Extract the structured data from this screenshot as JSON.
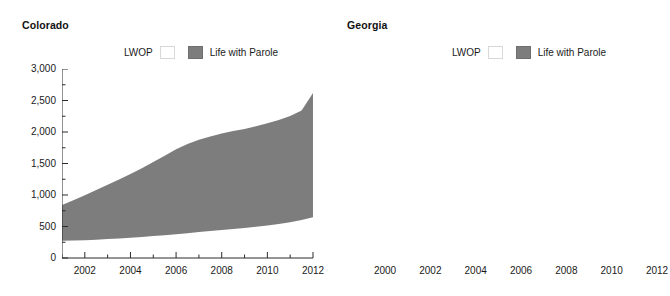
{
  "figure": {
    "panels": [
      {
        "id": "colorado",
        "title": "Colorado",
        "legend": [
          {
            "key": "lwop",
            "label": "LWOP",
            "color": "#ffffff"
          },
          {
            "key": "lwp",
            "label": "Life with Parole",
            "color": "#7d7d7d"
          }
        ],
        "y_ticks": [
          "0",
          "500",
          "1,000",
          "1,500",
          "2,000",
          "2,500",
          "3,000"
        ],
        "x_ticks": [
          "2002",
          "2004",
          "2006",
          "2008",
          "2010",
          "2012"
        ]
      },
      {
        "id": "georgia",
        "title": "Georgia",
        "legend": [
          {
            "key": "lwop",
            "label": "LWOP",
            "color": "#ffffff"
          },
          {
            "key": "lwp",
            "label": "Life with Parole",
            "color": "#7d7d7d"
          }
        ],
        "y_ticks": [
          "0",
          "2,000",
          "4,000",
          "6,000",
          "8,000",
          "10,000"
        ],
        "x_ticks": [
          "2000",
          "2002",
          "2004",
          "2006",
          "2008",
          "2010",
          "2012"
        ]
      }
    ]
  },
  "chart_data": [
    {
      "type": "area",
      "id": "colorado",
      "title": "Colorado",
      "stacked": true,
      "xlabel": "",
      "ylabel": "",
      "xlim": [
        2001.0,
        2012.0
      ],
      "ylim": [
        0,
        3000
      ],
      "ytick_values": [
        0,
        500,
        1000,
        1500,
        2000,
        2500,
        3000
      ],
      "ytick_labels": [
        "0",
        "500",
        "1,000",
        "1,500",
        "2,000",
        "2,500",
        "3,000"
      ],
      "xtick_values": [
        2002,
        2004,
        2006,
        2008,
        2010,
        2012
      ],
      "xtick_labels": [
        "2002",
        "2004",
        "2006",
        "2008",
        "2010",
        "2012"
      ],
      "minor_ticks": true,
      "grid": false,
      "legend_position": "above-plot",
      "x": [
        2001.0,
        2001.5,
        2002.0,
        2002.5,
        2003.0,
        2003.5,
        2004.0,
        2004.5,
        2005.0,
        2005.5,
        2006.0,
        2006.5,
        2007.0,
        2007.5,
        2008.0,
        2008.5,
        2009.0,
        2009.5,
        2010.0,
        2010.5,
        2011.0,
        2011.5,
        2012.0
      ],
      "series": [
        {
          "name": "LWOP",
          "color": "#ffffff",
          "values": [
            272,
            276,
            282,
            290,
            300,
            310,
            322,
            334,
            348,
            362,
            378,
            394,
            412,
            428,
            446,
            462,
            478,
            496,
            516,
            540,
            568,
            602,
            648
          ]
        },
        {
          "name": "Life with Parole",
          "color": "#7d7d7d",
          "values": [
            568,
            640,
            715,
            790,
            862,
            935,
            1010,
            1090,
            1175,
            1262,
            1348,
            1416,
            1466,
            1502,
            1530,
            1552,
            1570,
            1594,
            1622,
            1650,
            1684,
            1740,
            1972
          ]
        }
      ],
      "totals": [
        840,
        916,
        997,
        1080,
        1162,
        1245,
        1332,
        1424,
        1523,
        1624,
        1726,
        1810,
        1878,
        1930,
        1976,
        2014,
        2048,
        2090,
        2138,
        2190,
        2252,
        2342,
        2620
      ]
    },
    {
      "type": "area",
      "id": "georgia",
      "title": "Georgia",
      "stacked": true,
      "xlabel": "",
      "ylabel": "",
      "xlim": [
        2000.0,
        2012.0
      ],
      "ylim": [
        0,
        10000
      ],
      "ytick_values": [
        0,
        2000,
        4000,
        6000,
        8000,
        10000
      ],
      "ytick_labels": [
        "0",
        "2,000",
        "4,000",
        "6,000",
        "8,000",
        "10,000"
      ],
      "xtick_values": [
        2000,
        2002,
        2004,
        2006,
        2008,
        2010,
        2012
      ],
      "xtick_labels": [
        "2000",
        "2002",
        "2004",
        "2006",
        "2008",
        "2010",
        "2012"
      ],
      "minor_ticks": true,
      "grid": false,
      "legend_position": "above-plot",
      "x": [
        2000.0,
        2000.5,
        2001.0,
        2001.5,
        2002.0,
        2002.5,
        2003.0,
        2003.5,
        2004.0,
        2004.5,
        2005.0,
        2005.5,
        2006.0,
        2006.5,
        2007.0,
        2007.5,
        2008.0,
        2008.5,
        2009.0,
        2009.5,
        2010.0,
        2010.5,
        2011.0,
        2011.5,
        2012.0
      ],
      "series": [
        {
          "name": "LWOP",
          "color": "#ffffff",
          "values": [
            95,
            110,
            125,
            150,
            180,
            210,
            240,
            265,
            290,
            315,
            345,
            380,
            420,
            450,
            470,
            490,
            520,
            555,
            590,
            625,
            660,
            700,
            740,
            775,
            810
          ]
        },
        {
          "name": "Life with Parole",
          "color": "#7d7d7d",
          "values": [
            6105,
            6130,
            6160,
            6200,
            6250,
            6300,
            6330,
            6370,
            6420,
            6460,
            6490,
            6520,
            6550,
            6600,
            6650,
            6720,
            6790,
            6840,
            6900,
            6975,
            7050,
            7120,
            7190,
            7250,
            7290
          ]
        }
      ],
      "totals": [
        6200,
        6240,
        6285,
        6350,
        6430,
        6510,
        6570,
        6635,
        6710,
        6775,
        6835,
        6900,
        6970,
        7050,
        7120,
        7210,
        7310,
        7395,
        7490,
        7600,
        7710,
        7820,
        7930,
        8025,
        8100
      ]
    }
  ]
}
